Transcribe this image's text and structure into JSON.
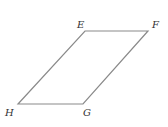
{
  "diagram": {
    "type": "parallelogram",
    "stroke_color": "#8a8a8a",
    "label_color": "#333333",
    "vertices": {
      "E": {
        "label": "E",
        "x": 85,
        "y": 31
      },
      "F": {
        "label": "F",
        "x": 148,
        "y": 31
      },
      "G": {
        "label": "G",
        "x": 83,
        "y": 104
      },
      "H": {
        "label": "H",
        "x": 18,
        "y": 104
      }
    }
  }
}
